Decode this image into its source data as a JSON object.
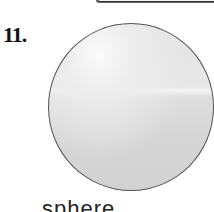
{
  "problem": {
    "number": "11.",
    "figure": {
      "shape": "sphere",
      "fill_color": "#dedede",
      "outline_color": "#555555"
    },
    "label": "sphere"
  }
}
